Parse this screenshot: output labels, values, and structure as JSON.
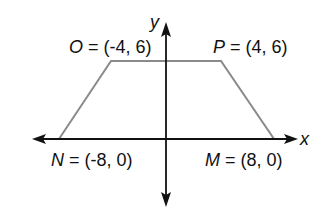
{
  "figure": {
    "axes": {
      "x_label": "x",
      "y_label": "y",
      "stroke": "#111111"
    },
    "shape": {
      "type": "trapezoid",
      "stroke": "#8a8a8a",
      "vertices": [
        {
          "name": "N",
          "coords": "(-8, 0)",
          "x": -8,
          "y": 0,
          "label_suffix": " = (-8, 0)"
        },
        {
          "name": "O",
          "coords": "(-4, 6)",
          "x": -4,
          "y": 6,
          "label_suffix": " = (-4, 6)"
        },
        {
          "name": "P",
          "coords": "(4, 6)",
          "x": 4,
          "y": 6,
          "label_suffix": " = (4, 6)"
        },
        {
          "name": "M",
          "coords": "(8, 0)",
          "x": 8,
          "y": 0,
          "label_suffix": " = (8, 0)"
        }
      ]
    }
  }
}
